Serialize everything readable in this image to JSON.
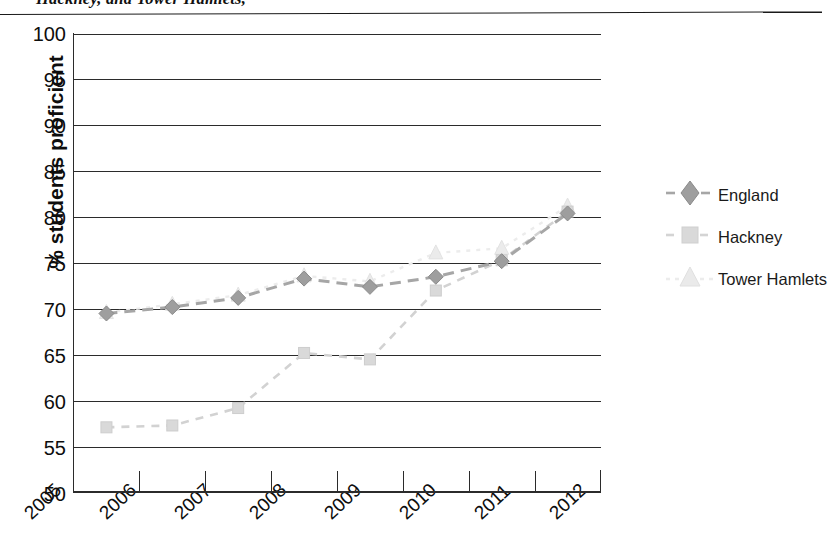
{
  "title": {
    "text": "Hackney, and Tower Hamlets,",
    "clipped": true
  },
  "axes": {
    "ylabel": "% students proficient",
    "xlabel": "",
    "yticks": [
      100,
      95,
      90,
      85,
      80,
      75,
      70,
      65,
      60,
      55,
      50
    ],
    "ylim": [
      50,
      100
    ],
    "xticks": [
      "2005",
      "2006",
      "2007",
      "2008",
      "2009",
      "2010",
      "2011",
      "2012"
    ],
    "grid": "horizontal"
  },
  "legend": {
    "position": "right",
    "items": [
      {
        "label": "England",
        "marker": "diamond",
        "color": "#9a9a9a",
        "line": "dashed"
      },
      {
        "label": "Hackney",
        "marker": "square",
        "color": "#cfcfcf",
        "line": "dashed"
      },
      {
        "label": "Tower Hamlets",
        "marker": "triangle",
        "color": "#e2e2e2",
        "line": "dashed"
      }
    ]
  },
  "chart_data": {
    "type": "line",
    "title": "Hackney, and Tower Hamlets,",
    "xlabel": "",
    "ylabel": "% students proficient",
    "ylim": [
      50,
      100
    ],
    "grid": true,
    "legend_position": "right",
    "x": [
      "2005",
      "2006",
      "2007",
      "2008",
      "2009",
      "2010",
      "2011",
      "2012"
    ],
    "series": [
      {
        "name": "England",
        "marker": "diamond",
        "color": "#9a9a9a",
        "values": [
          69.5,
          70.2,
          71.2,
          73.3,
          72.4,
          73.5,
          75.2,
          80.4
        ]
      },
      {
        "name": "Hackney",
        "marker": "square",
        "color": "#cfcfcf",
        "values": [
          57.1,
          57.3,
          59.2,
          65.2,
          64.5,
          72.0,
          75.3,
          80.6
        ]
      },
      {
        "name": "Tower Hamlets",
        "marker": "triangle",
        "color": "#e2e2e2",
        "values": [
          69.6,
          70.5,
          71.5,
          73.6,
          73.0,
          76.1,
          76.6,
          81.2
        ]
      }
    ]
  }
}
